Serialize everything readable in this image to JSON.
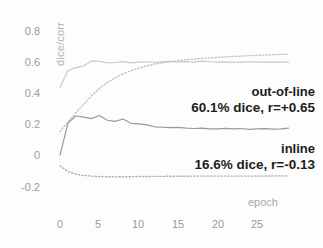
{
  "chart_data": {
    "type": "line",
    "title": "",
    "xlabel": "epoch",
    "ylabel": "dice/corr",
    "xlim": [
      0,
      29
    ],
    "ylim": [
      -0.3,
      0.9
    ],
    "grid": false,
    "legend_position": "inline-annotations",
    "xticks": [
      0,
      5,
      10,
      15,
      20,
      25
    ],
    "xtick_labels": [
      "0",
      "5",
      "10",
      "15",
      "20",
      "25"
    ],
    "yticks": [
      0.8,
      0.6,
      0.4,
      0.2,
      0,
      -0.2
    ],
    "ytick_labels": [
      "0.8",
      "0.6",
      "0.4",
      "0.2",
      "0",
      "-0.2"
    ],
    "x": [
      0,
      1,
      2,
      3,
      4,
      5,
      6,
      7,
      8,
      9,
      10,
      11,
      12,
      13,
      14,
      15,
      16,
      17,
      18,
      19,
      20,
      21,
      22,
      23,
      24,
      25,
      26,
      27,
      28,
      29
    ],
    "series": [
      {
        "name": "out-of-line dice",
        "style": "solid",
        "color": "#c9c9c9",
        "values": [
          0.44,
          0.545,
          0.565,
          0.575,
          0.608,
          0.606,
          0.596,
          0.598,
          0.604,
          0.596,
          0.601,
          0.603,
          0.598,
          0.602,
          0.605,
          0.6,
          0.604,
          0.601,
          0.607,
          0.603,
          0.6,
          0.602,
          0.599,
          0.601,
          0.603,
          0.6,
          0.601,
          0.602,
          0.6,
          0.601
        ]
      },
      {
        "name": "out-of-line corr",
        "style": "dotted",
        "color": "#c2c2c2",
        "values": [
          0.155,
          0.215,
          0.275,
          0.33,
          0.385,
          0.432,
          0.47,
          0.5,
          0.525,
          0.545,
          0.562,
          0.576,
          0.588,
          0.597,
          0.604,
          0.61,
          0.616,
          0.62,
          0.624,
          0.628,
          0.631,
          0.634,
          0.637,
          0.639,
          0.642,
          0.644,
          0.646,
          0.648,
          0.65,
          0.652
        ]
      },
      {
        "name": "inline dice",
        "style": "solid",
        "color": "#9a9a9a",
        "values": [
          0.005,
          0.21,
          0.255,
          0.248,
          0.238,
          0.258,
          0.228,
          0.221,
          0.236,
          0.208,
          0.205,
          0.198,
          0.186,
          0.183,
          0.18,
          0.182,
          0.177,
          0.175,
          0.178,
          0.172,
          0.173,
          0.176,
          0.172,
          0.175,
          0.17,
          0.172,
          0.174,
          0.171,
          0.173,
          0.178
        ]
      },
      {
        "name": "inline corr",
        "style": "dotted",
        "color": "#b0b0b0",
        "values": [
          -0.065,
          -0.1,
          -0.118,
          -0.126,
          -0.13,
          -0.133,
          -0.134,
          -0.135,
          -0.134,
          -0.134,
          -0.133,
          -0.133,
          -0.132,
          -0.132,
          -0.131,
          -0.131,
          -0.131,
          -0.13,
          -0.13,
          -0.13,
          -0.13,
          -0.13,
          -0.13,
          -0.13,
          -0.13,
          -0.13,
          -0.13,
          -0.129,
          -0.129,
          -0.129
        ]
      }
    ],
    "annotations": [
      {
        "id": "out-of-line",
        "title": "out-of-line",
        "detail": "60.1% dice, r=+0.65"
      },
      {
        "id": "inline",
        "title": "inline",
        "detail": "16.6% dice, r=-0.13"
      }
    ]
  },
  "colors": {
    "background": "#fdfdfd",
    "tick_text": "#9b9b9b",
    "annotation_text": "#1c1c1c",
    "axis_title": "#b2b2b2"
  }
}
